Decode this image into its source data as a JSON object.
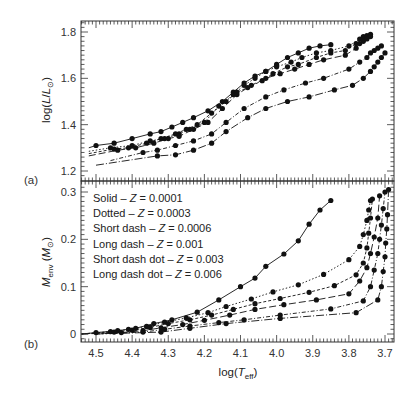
{
  "chart_data": [
    {
      "panel": "(a)",
      "type": "line",
      "xlabel": "log(T_eff)",
      "ylabel": "log(L/L_sun)",
      "ylim": [
        1.18,
        1.84
      ],
      "xlim": [
        4.54,
        3.65
      ],
      "x_reversed": true,
      "yticks": [
        1.2,
        1.4,
        1.6,
        1.8
      ],
      "ytick_labels": [
        "1.2",
        "1.4",
        "1.6",
        "1.8"
      ],
      "grid": false,
      "series": [
        {
          "name": "Solid - Z=0.0001",
          "dash": "",
          "x_start": 4.52,
          "y_start": 1.3,
          "x": [
            4.5,
            4.45,
            4.4,
            4.35,
            4.32,
            4.29,
            4.26,
            4.23,
            4.19,
            4.15,
            4.12,
            4.09,
            4.06,
            4.03,
            4.0,
            3.97,
            3.94,
            3.91,
            3.88,
            3.85
          ],
          "y": [
            1.31,
            1.32,
            1.34,
            1.36,
            1.37,
            1.39,
            1.41,
            1.43,
            1.46,
            1.5,
            1.54,
            1.58,
            1.61,
            1.63,
            1.66,
            1.69,
            1.71,
            1.73,
            1.74,
            1.745
          ]
        },
        {
          "name": "Dotted - Z=0.0003",
          "dash": "1.5,2",
          "x_start": 4.52,
          "y_start": 1.285,
          "x": [
            4.46,
            4.4,
            4.35,
            4.31,
            4.27,
            4.24,
            4.2,
            4.16,
            4.12,
            4.09,
            4.06,
            4.03,
            4.0,
            3.96,
            3.93,
            3.89,
            3.85,
            3.8,
            3.77,
            3.76,
            3.75,
            3.74
          ],
          "y": [
            1.3,
            1.31,
            1.33,
            1.34,
            1.36,
            1.38,
            1.41,
            1.48,
            1.53,
            1.57,
            1.6,
            1.63,
            1.65,
            1.67,
            1.69,
            1.71,
            1.72,
            1.74,
            1.77,
            1.78,
            1.785,
            1.79
          ]
        },
        {
          "name": "Short dash - Z=0.0006",
          "dash": "3,2",
          "x_start": 4.52,
          "y_start": 1.275,
          "x": [
            4.45,
            4.41,
            4.36,
            4.32,
            4.28,
            4.25,
            4.22,
            4.18,
            4.14,
            4.11,
            4.08,
            4.04,
            4.01,
            3.97,
            3.94,
            3.89,
            3.85,
            3.81,
            3.78,
            3.76,
            3.75,
            3.74
          ],
          "y": [
            1.295,
            1.3,
            1.32,
            1.34,
            1.36,
            1.38,
            1.4,
            1.45,
            1.5,
            1.54,
            1.56,
            1.59,
            1.62,
            1.65,
            1.66,
            1.69,
            1.71,
            1.72,
            1.75,
            1.77,
            1.775,
            1.78
          ]
        },
        {
          "name": "Long dash - Z=0.001",
          "dash": "7,3",
          "x_start": 4.52,
          "y_start": 1.265,
          "x": [
            4.44,
            4.39,
            4.34,
            4.3,
            4.27,
            4.23,
            4.19,
            4.15,
            4.11,
            4.07,
            4.03,
            3.99,
            3.95,
            3.91,
            3.87,
            3.81,
            3.78,
            3.77,
            3.76,
            3.75
          ],
          "y": [
            1.29,
            1.3,
            1.32,
            1.34,
            1.35,
            1.38,
            1.41,
            1.47,
            1.53,
            1.57,
            1.6,
            1.62,
            1.64,
            1.66,
            1.68,
            1.7,
            1.73,
            1.75,
            1.76,
            1.77
          ]
        },
        {
          "name": "Short dash dot - Z=0.003",
          "dash": "4,2,1,2",
          "x_start": 4.46,
          "y_start": 1.245,
          "x": [
            4.37,
            4.33,
            4.28,
            4.23,
            4.18,
            4.14,
            4.09,
            4.03,
            3.98,
            3.92,
            3.87,
            3.8,
            3.77,
            3.75,
            3.74,
            3.73,
            3.72,
            3.71
          ],
          "y": [
            1.28,
            1.29,
            1.31,
            1.33,
            1.36,
            1.41,
            1.47,
            1.52,
            1.55,
            1.58,
            1.6,
            1.64,
            1.67,
            1.69,
            1.71,
            1.72,
            1.73,
            1.74
          ]
        },
        {
          "name": "Long dash dot - Z=0.006",
          "dash": "8,2,1,2",
          "x_start": 4.5,
          "y_start": 1.225,
          "x": [
            4.33,
            4.28,
            4.23,
            4.18,
            4.14,
            4.08,
            4.03,
            3.97,
            3.91,
            3.84,
            3.79,
            3.76,
            3.74,
            3.73,
            3.72,
            3.71,
            3.7
          ],
          "y": [
            1.265,
            1.27,
            1.29,
            1.32,
            1.37,
            1.43,
            1.47,
            1.5,
            1.52,
            1.55,
            1.57,
            1.6,
            1.63,
            1.65,
            1.67,
            1.69,
            1.71
          ]
        }
      ]
    },
    {
      "panel": "(b)",
      "type": "line",
      "xlabel": "log(T_eff)",
      "ylabel": "M_env (M_sun)",
      "ylim": [
        -0.017,
        0.315
      ],
      "xlim": [
        4.54,
        3.65
      ],
      "x_reversed": true,
      "yticks": [
        0,
        0.1,
        0.2,
        0.3
      ],
      "ytick_labels": [
        "0",
        "0.1",
        "0.2",
        "0.3"
      ],
      "xticks": [
        4.5,
        4.4,
        4.3,
        4.2,
        4.1,
        4.0,
        3.9,
        3.8,
        3.7
      ],
      "xtick_labels": [
        "4.5",
        "4.4",
        "4.3",
        "4.2",
        "4.1",
        "4.0",
        "3.9",
        "3.8",
        "3.7"
      ],
      "grid": false,
      "legend_position": "upper left",
      "series": [
        {
          "name": "Solid - Z=0.0001",
          "dash": "",
          "x_start": 4.54,
          "y_start": 0.0,
          "x": [
            4.5,
            4.44,
            4.39,
            4.34,
            4.29,
            4.22,
            4.16,
            4.1,
            4.06,
            4.03,
            3.98,
            3.94,
            3.91,
            3.88,
            3.85
          ],
          "y": [
            0.003,
            0.007,
            0.012,
            0.022,
            0.03,
            0.046,
            0.072,
            0.1,
            0.118,
            0.143,
            0.169,
            0.197,
            0.232,
            0.262,
            0.282
          ]
        },
        {
          "name": "Dotted - Z=0.0003",
          "dash": "1.5,2",
          "x_start": 4.54,
          "y_start": 0.0,
          "x": [
            4.46,
            4.41,
            4.36,
            4.31,
            4.25,
            4.19,
            4.14,
            4.07,
            4.01,
            3.94,
            3.87,
            3.8,
            3.77,
            3.76,
            3.75,
            3.745,
            3.74
          ],
          "y": [
            0.005,
            0.01,
            0.016,
            0.025,
            0.034,
            0.045,
            0.058,
            0.074,
            0.089,
            0.104,
            0.126,
            0.157,
            0.185,
            0.21,
            0.24,
            0.262,
            0.282
          ]
        },
        {
          "name": "Short dash - Z=0.0006",
          "dash": "3,2",
          "x_start": 4.54,
          "y_start": 0.0,
          "x": [
            4.45,
            4.4,
            4.35,
            4.3,
            4.24,
            4.18,
            4.12,
            4.06,
            3.99,
            3.91,
            3.84,
            3.78,
            3.76,
            3.75,
            3.745,
            3.74,
            3.735
          ],
          "y": [
            0.004,
            0.008,
            0.014,
            0.022,
            0.03,
            0.04,
            0.052,
            0.064,
            0.075,
            0.088,
            0.102,
            0.125,
            0.15,
            0.182,
            0.213,
            0.245,
            0.285
          ]
        },
        {
          "name": "Long dash - Z=0.001",
          "dash": "7,3",
          "x_start": 4.54,
          "y_start": 0.0,
          "x": [
            4.43,
            4.37,
            4.32,
            4.26,
            4.2,
            4.13,
            4.06,
            3.98,
            3.89,
            3.8,
            3.77,
            3.75,
            3.74,
            3.73,
            3.72,
            3.715
          ],
          "y": [
            0.003,
            0.007,
            0.013,
            0.02,
            0.029,
            0.04,
            0.052,
            0.062,
            0.072,
            0.085,
            0.112,
            0.14,
            0.17,
            0.205,
            0.245,
            0.292
          ]
        },
        {
          "name": "Short dash dot - Z=0.003",
          "dash": "4,2,1,2",
          "x_start": 4.5,
          "y_start": 0.0,
          "x": [
            4.37,
            4.31,
            4.24,
            4.16,
            4.09,
            3.99,
            3.85,
            3.76,
            3.74,
            3.73,
            3.72,
            3.715,
            3.71,
            3.705,
            3.7
          ],
          "y": [
            0.004,
            0.01,
            0.017,
            0.024,
            0.03,
            0.04,
            0.053,
            0.07,
            0.1,
            0.135,
            0.17,
            0.2,
            0.23,
            0.265,
            0.3
          ]
        },
        {
          "name": "Long dash dot - Z=0.006",
          "dash": "8,2,1,2",
          "x_start": 4.5,
          "y_start": 0.0,
          "x": [
            4.32,
            4.24,
            4.14,
            3.99,
            3.78,
            3.72,
            3.71,
            3.705,
            3.7,
            3.698,
            3.695,
            3.693,
            3.69
          ],
          "y": [
            0.004,
            0.012,
            0.022,
            0.033,
            0.045,
            0.072,
            0.1,
            0.132,
            0.163,
            0.192,
            0.222,
            0.252,
            0.305
          ]
        }
      ]
    }
  ],
  "panels": {
    "a": {
      "label": "(a)",
      "ylabel_main": "log(",
      "ylabel_italic": "L",
      "ylabel_mid": "/",
      "ylabel_italic2": "L",
      "ylabel_sub": "⊙",
      "ylabel_end": ")"
    },
    "b": {
      "label": "(b)",
      "ylabel_italic": "M",
      "ylabel_sub": "env",
      "ylabel_mid": " (",
      "ylabel_italic2": "M",
      "ylabel_sub2": "⊙",
      "ylabel_end": ")"
    }
  },
  "xaxis": {
    "label_main": "log(",
    "label_italic": "T",
    "label_sub": "eff",
    "label_end": ")"
  },
  "legend": {
    "items": [
      {
        "style": "Solid",
        "z": "0.0001"
      },
      {
        "style": "Dotted",
        "z": "0.0003"
      },
      {
        "style": "Short dash",
        "z": "0.0006"
      },
      {
        "style": "Long dash",
        "z": "0.001"
      },
      {
        "style": "Short dash dot",
        "z": "0.003"
      },
      {
        "style": "Long dash dot",
        "z": "0.006"
      }
    ],
    "separator": " – ",
    "z_symbol": "Z",
    "equals": " = "
  },
  "colors": {
    "line": "#111111",
    "axis": "#333333",
    "background": "#ffffff"
  }
}
